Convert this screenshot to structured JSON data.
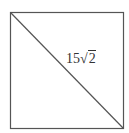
{
  "diagram": {
    "shape": "square",
    "has_diagonal": true,
    "diagonal_label": {
      "coefficient": "15",
      "radical_symbol": "√",
      "radicand": "2",
      "full_text": "15√2"
    },
    "colors": {
      "stroke": "#555555",
      "background": "#ffffff",
      "text": "#333333"
    }
  }
}
